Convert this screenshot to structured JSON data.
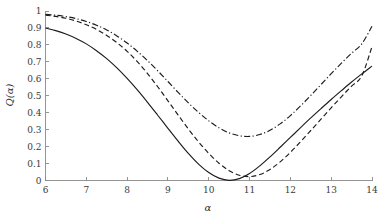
{
  "chart_data": {
    "type": "line",
    "title": "",
    "subtitle": "",
    "xlabel": "α",
    "ylabel": "Q(α)",
    "xlim": [
      6,
      14
    ],
    "ylim": [
      0,
      1
    ],
    "grid": false,
    "legend": "none",
    "xticks": [
      "6",
      "7",
      "8",
      "9",
      "10",
      "11",
      "12",
      "13",
      "14"
    ],
    "xtick_values": [
      6,
      7,
      8,
      9,
      10,
      11,
      12,
      13,
      14
    ],
    "yticks": [
      "0",
      "0.1",
      "0.2",
      "0.3",
      "0.4",
      "0.5",
      "0.6",
      "0.7",
      "0.8",
      "0.9",
      "1"
    ],
    "ytick_values": [
      0,
      0.1,
      0.2,
      0.3,
      0.4,
      0.5,
      0.6,
      0.7,
      0.8,
      0.9,
      1
    ],
    "x": [
      6.0,
      6.25,
      6.5,
      6.75,
      7.0,
      7.25,
      7.5,
      7.75,
      8.0,
      8.25,
      8.5,
      8.75,
      9.0,
      9.25,
      9.5,
      9.75,
      10.0,
      10.25,
      10.5,
      10.75,
      11.0,
      11.25,
      11.5,
      11.75,
      12.0,
      12.25,
      12.5,
      12.75,
      13.0,
      13.25,
      13.5,
      13.75,
      14.0
    ],
    "series": [
      {
        "name": "solid",
        "style": "solid",
        "color": "#1c1c1c",
        "values": [
          0.9,
          0.884,
          0.864,
          0.838,
          0.806,
          0.766,
          0.719,
          0.664,
          0.602,
          0.534,
          0.461,
          0.385,
          0.308,
          0.232,
          0.16,
          0.097,
          0.047,
          0.014,
          0.001,
          0.011,
          0.041,
          0.086,
          0.139,
          0.196,
          0.254,
          0.312,
          0.369,
          0.424,
          0.478,
          0.53,
          0.581,
          0.629,
          0.675
        ]
      },
      {
        "name": "dashed",
        "style": "dashed",
        "color": "#1c1c1c",
        "values": [
          0.975,
          0.968,
          0.957,
          0.941,
          0.919,
          0.891,
          0.856,
          0.813,
          0.762,
          0.701,
          0.631,
          0.553,
          0.47,
          0.386,
          0.304,
          0.228,
          0.16,
          0.102,
          0.058,
          0.031,
          0.023,
          0.035,
          0.065,
          0.11,
          0.166,
          0.229,
          0.295,
          0.362,
          0.429,
          0.494,
          0.557,
          0.617,
          0.79
        ]
      },
      {
        "name": "dash-dot",
        "style": "dashdot",
        "color": "#1c1c1c",
        "values": [
          0.98,
          0.975,
          0.967,
          0.955,
          0.938,
          0.916,
          0.888,
          0.853,
          0.811,
          0.762,
          0.707,
          0.647,
          0.584,
          0.52,
          0.458,
          0.402,
          0.352,
          0.311,
          0.281,
          0.264,
          0.26,
          0.271,
          0.296,
          0.334,
          0.383,
          0.44,
          0.502,
          0.566,
          0.63,
          0.692,
          0.751,
          0.806,
          0.91
        ]
      }
    ],
    "minima": [
      {
        "series": "solid",
        "x": 10.5,
        "y": 0.0
      },
      {
        "series": "dashed",
        "x": 10.85,
        "y": 0.023
      },
      {
        "series": "dash-dot",
        "x": 11.0,
        "y": 0.26
      }
    ],
    "endpoints": {
      "left": {
        "solid": 0.9,
        "dashed": 0.975,
        "dash-dot": 0.98
      },
      "right": {
        "solid": 0.675,
        "dashed": 0.79,
        "dash-dot": 0.91
      }
    }
  }
}
